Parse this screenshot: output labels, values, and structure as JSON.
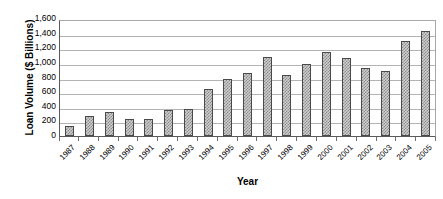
{
  "chart_data": {
    "type": "bar",
    "title": "",
    "xlabel": "Year",
    "ylabel": "Loan Volume ($ Billions)",
    "categories": [
      "1987",
      "1988",
      "1989",
      "1990",
      "1991",
      "1992",
      "1993",
      "1994",
      "1995",
      "1996",
      "1997",
      "1998",
      "1999",
      "2000",
      "2001",
      "2002",
      "2003",
      "2004",
      "2005"
    ],
    "values": [
      135,
      280,
      330,
      240,
      230,
      365,
      380,
      650,
      800,
      870,
      1100,
      850,
      995,
      1175,
      1085,
      945,
      905,
      1320,
      1460
    ],
    "series": [
      {
        "name": "Loan Volume",
        "values": [
          135,
          280,
          330,
          240,
          230,
          365,
          380,
          650,
          800,
          870,
          1100,
          850,
          995,
          1175,
          1085,
          945,
          905,
          1320,
          1460
        ]
      }
    ],
    "ylim": [
      0,
      1600
    ],
    "ytick_values": [
      0,
      200,
      400,
      600,
      800,
      1000,
      1200,
      1400,
      1600
    ],
    "ytick_labels": [
      "0",
      "200",
      "400",
      "600",
      "800",
      "1,000",
      "1,200",
      "1,400",
      "1,600"
    ],
    "grid": true,
    "grid_axis": "y",
    "legend": false,
    "legend_position": "none",
    "bar_fill": "#cdcdcd",
    "bar_pattern": "checkered-hatch",
    "bar_border_color": "#4a4a4a",
    "gridline_color": "#b4b4b4",
    "axis_color": "#5a5a5a",
    "background": "#ffffff"
  }
}
